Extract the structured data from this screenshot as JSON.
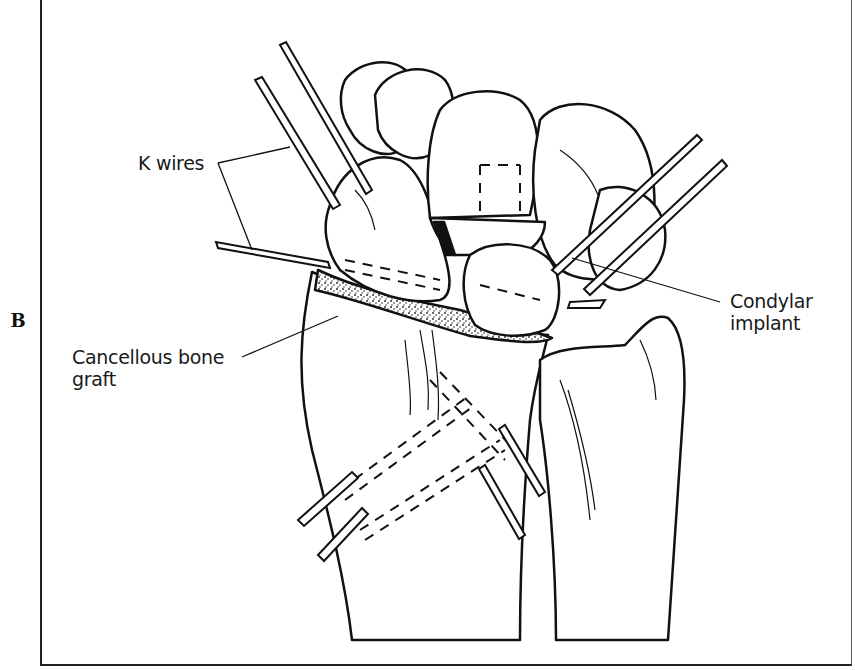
{
  "figure": {
    "panel_letter": "B",
    "labels": {
      "k_wires": "K wires",
      "condylar_implant_line1": "Condylar",
      "condylar_implant_line2": "implant",
      "cancellous_line1": "Cancellous bone",
      "cancellous_line2": "graft"
    },
    "colors": {
      "ink": "#111111",
      "background": "#ffffff",
      "graft_stipple": "#333333"
    }
  }
}
